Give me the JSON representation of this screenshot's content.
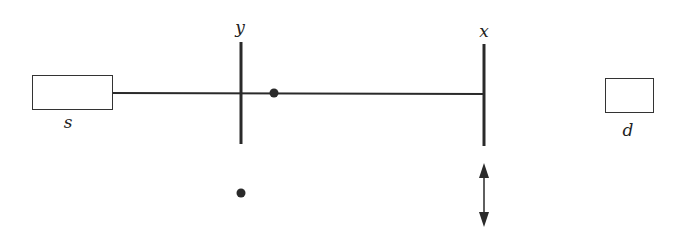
{
  "diagram": {
    "labels": {
      "source": "s",
      "detector": "d",
      "barrier_y": "y",
      "barrier_x": "x"
    },
    "colors": {
      "stroke": "#2a2a2a",
      "box_stroke": "#333333",
      "background": "#ffffff"
    }
  }
}
